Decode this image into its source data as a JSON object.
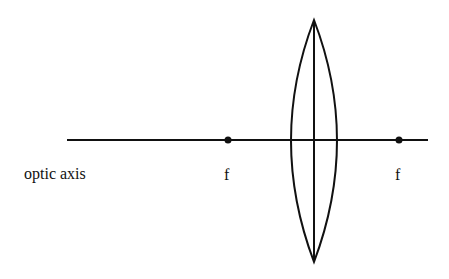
{
  "diagram": {
    "type": "converging-lens-ray-diagram",
    "labels": {
      "axis": "optic axis",
      "focal_left": "f",
      "focal_right": "f"
    },
    "colors": {
      "stroke": "#111111",
      "background": "#ffffff"
    }
  }
}
